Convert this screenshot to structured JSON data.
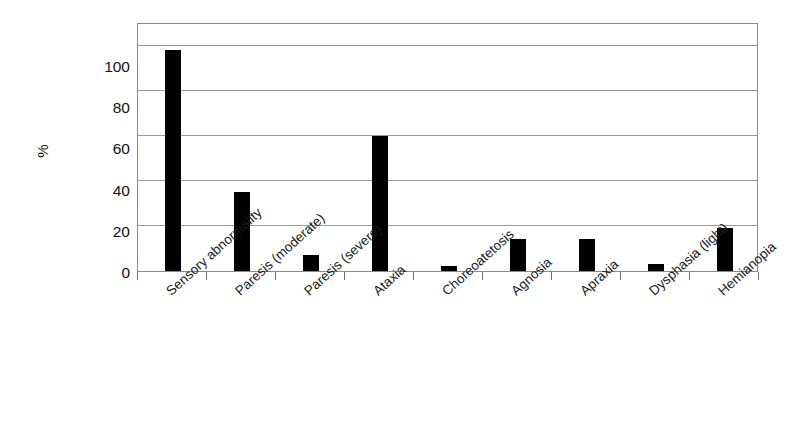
{
  "chart_data": {
    "type": "bar",
    "title": "",
    "xlabel": "",
    "ylabel": "%",
    "ylim": [
      0,
      110
    ],
    "yticks": [
      0,
      20,
      40,
      60,
      80,
      100
    ],
    "grid": true,
    "legend": false,
    "bar_color": "#000000",
    "categories": [
      "Sensory abnormality",
      "Paresis (moderate)",
      "Paresis (severe)",
      "Ataxia",
      "Choreoatetosis",
      "Agnosia",
      "Apraxia",
      "Dysphasia (light)",
      "Hemianopia"
    ],
    "values": [
      98,
      35,
      7,
      60,
      2,
      14,
      14,
      3,
      19
    ]
  },
  "axis": {
    "y_title": "%",
    "y_tick_labels": [
      "100",
      "80",
      "60",
      "40",
      "20",
      "0"
    ]
  }
}
